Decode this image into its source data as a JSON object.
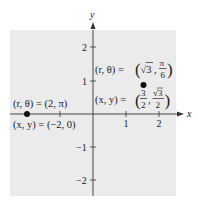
{
  "figure": {
    "type": "coordinate-plane",
    "axes": {
      "x_label": "x",
      "y_label": "y",
      "x_ticks": [
        {
          "value": 1,
          "label": "1"
        },
        {
          "value": 2,
          "label": "2"
        }
      ],
      "y_ticks": [
        {
          "value": 2,
          "label": "2"
        },
        {
          "value": 1,
          "label": "1"
        },
        {
          "value": -1,
          "label": "−1"
        },
        {
          "value": -2,
          "label": "−2"
        }
      ],
      "range_x": [
        -2.5,
        2.5
      ],
      "range_y": [
        -2.5,
        2.5
      ]
    },
    "points": [
      {
        "name": "point-a",
        "x": -2,
        "y": 0,
        "polar_label": "(r, θ) = (2, π)",
        "rect_label": "(x, y) = (−2, 0)"
      },
      {
        "name": "point-b",
        "x": 1.5,
        "y": 0.866,
        "polar_label_prefix": "(r, θ) = ",
        "polar_r": "√3",
        "polar_theta_num": "π",
        "polar_theta_den": "6",
        "rect_label_prefix": "(x, y) = ",
        "rect_x_num": "3",
        "rect_x_den": "2",
        "rect_y_num": "√3",
        "rect_y_den": "2"
      }
    ],
    "colors": {
      "panel": "#ebebeb",
      "axis": "#333333",
      "point": "#111111"
    }
  }
}
